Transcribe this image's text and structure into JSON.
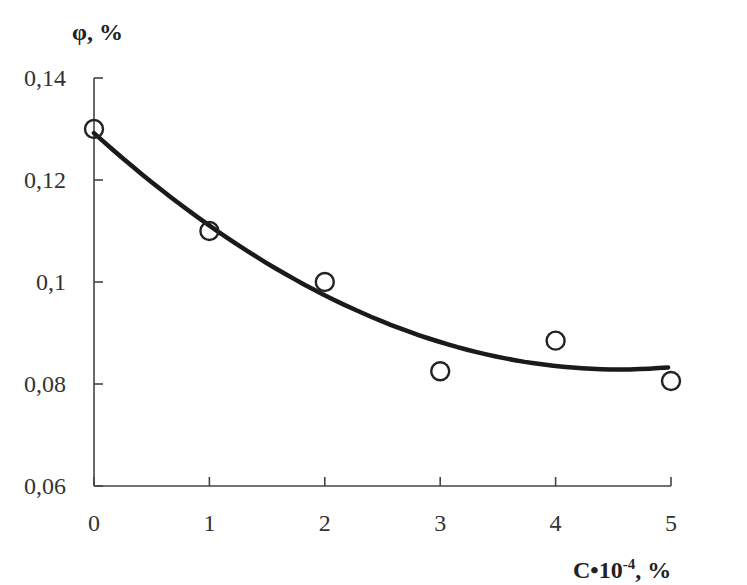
{
  "chart_data": {
    "type": "scatter",
    "title": "",
    "xlabel": "C•10⁻⁴, %",
    "xlabel_parts": {
      "base": "C•10",
      "sup": "-4",
      "suffix": ", %"
    },
    "ylabel": "φ, %",
    "xlim": [
      0,
      5
    ],
    "ylim": [
      0.06,
      0.14
    ],
    "x_ticks": [
      0,
      1,
      2,
      3,
      4,
      5
    ],
    "x_tick_labels": [
      "0",
      "1",
      "2",
      "3",
      "4",
      "5"
    ],
    "y_ticks": [
      0.06,
      0.08,
      0.1,
      0.12,
      0.14
    ],
    "y_tick_labels": [
      "0,06",
      "0,08",
      "0,1",
      "0,12",
      "0,14"
    ],
    "grid": false,
    "legend": null,
    "series": [
      {
        "name": "measured",
        "style": "open-circle-markers",
        "x": [
          0,
          1,
          2,
          3,
          4,
          5
        ],
        "y": [
          0.13,
          0.11,
          0.1,
          0.0825,
          0.0885,
          0.0806
        ]
      },
      {
        "name": "trend",
        "style": "solid-line",
        "fit": "quadratic",
        "coefficients": {
          "a": 0.00224,
          "b": -0.02038,
          "c": 0.1292
        },
        "x": [
          0,
          1,
          2,
          3,
          4,
          5
        ],
        "y": [
          0.1292,
          0.1111,
          0.0976,
          0.0883,
          0.0835,
          0.0833
        ]
      }
    ]
  },
  "colors": {
    "axis": "#444444",
    "line": "#1a1a1a",
    "marker": "#222222",
    "text": "#333333",
    "background": "#ffffff"
  }
}
